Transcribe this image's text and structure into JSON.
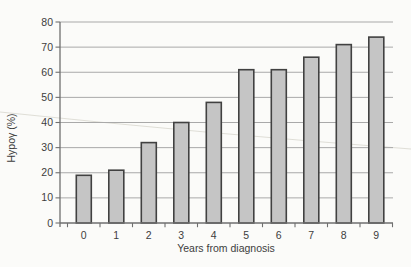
{
  "figure": {
    "background": "#fbfbf9"
  },
  "chart_data": {
    "type": "bar",
    "title": "",
    "xlabel": "Years from diagnosis",
    "ylabel": "Hypoγ (%)",
    "categories": [
      "0",
      "1",
      "2",
      "3",
      "4",
      "5",
      "6",
      "7",
      "8",
      "9"
    ],
    "values": [
      19,
      21,
      32,
      40,
      48,
      61,
      61,
      66,
      71,
      74
    ],
    "ylim": [
      0,
      80
    ],
    "yticks": [
      0,
      10,
      20,
      30,
      40,
      50,
      60,
      70,
      80
    ],
    "grid": true,
    "legend": "none",
    "colors": {
      "bar_fill": "#c5c5c5",
      "bar_stroke": "#414141",
      "gridline": "#a9a9a9",
      "axis": "#6f6f6f",
      "text": "#3d3d3d",
      "scan_artifact": "#dcdad3"
    }
  }
}
